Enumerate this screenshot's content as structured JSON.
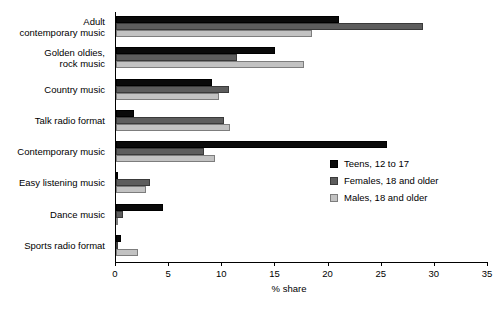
{
  "chart_data": {
    "type": "bar",
    "orientation": "horizontal",
    "title": "",
    "xlabel": "% share",
    "ylabel": "",
    "xlim": [
      0,
      35
    ],
    "xticks": [
      0,
      5,
      10,
      15,
      20,
      25,
      30,
      35
    ],
    "grid": false,
    "legend_position": "middle-right",
    "categories": [
      "Adult contemporary music",
      "Golden oldies, rock music",
      "Country music",
      "Talk radio format",
      "Contemporary music",
      "Easy listening music",
      "Dance music",
      "Sports radio format"
    ],
    "category_lines": [
      [
        "Adult",
        "contemporary music"
      ],
      [
        "Golden oldies,",
        "rock music"
      ],
      [
        "Country music"
      ],
      [
        "Talk radio format"
      ],
      [
        "Contemporary music"
      ],
      [
        "Easy listening music"
      ],
      [
        "Dance music"
      ],
      [
        "Sports radio format"
      ]
    ],
    "series": [
      {
        "name": "Teens, 12 to 17",
        "color": "#0a0a0a",
        "values": [
          21.0,
          15.0,
          9.0,
          1.7,
          25.5,
          0.2,
          4.4,
          0.5
        ]
      },
      {
        "name": "Females, 18 and older",
        "color": "#5d5d5d",
        "values": [
          28.9,
          11.4,
          10.6,
          10.2,
          8.3,
          3.2,
          0.7,
          0.2
        ]
      },
      {
        "name": "Males, 18 and older",
        "color": "#c2c2c2",
        "values": [
          18.4,
          17.7,
          9.7,
          10.7,
          9.3,
          2.8,
          0.2,
          2.1
        ]
      }
    ]
  }
}
